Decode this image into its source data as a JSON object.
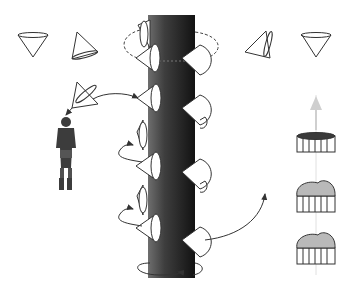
{
  "diagram": {
    "title": "",
    "colors": {
      "background": "#ffffff",
      "stroke": "#333333",
      "pillar_dark": "#1e1e1e",
      "pillar_light": "#6a6a6a",
      "cup_top_fill": "#b9b9b9",
      "cup_top_dark": "#3a3a3a",
      "arrow_light": "#d0d0d0",
      "person": "#3c3c3c"
    },
    "cones_top_row": [
      {
        "id": "cone-1",
        "orientation": "down"
      },
      {
        "id": "cone-2",
        "orientation": "tilted-left"
      },
      {
        "id": "cone-3",
        "orientation": "tilted-right"
      },
      {
        "id": "cone-4",
        "orientation": "down"
      }
    ],
    "spiral_cones_count": 10,
    "cups": [
      {
        "id": "cup-1",
        "top": "dark"
      },
      {
        "id": "cup-2",
        "top": "mound"
      },
      {
        "id": "cup-3",
        "top": "mound"
      }
    ],
    "labels": []
  }
}
